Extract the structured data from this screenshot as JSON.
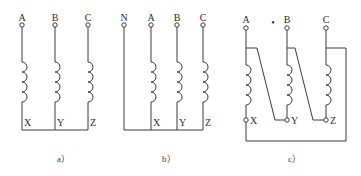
{
  "diagrams": {
    "a": {
      "caption": "a）",
      "top_labels": [
        "A",
        "B",
        "C"
      ],
      "bottom_labels": [
        "X",
        "Y",
        "Z"
      ]
    },
    "b": {
      "caption": "b）",
      "top_labels": [
        "N",
        "A",
        "B",
        "C"
      ],
      "bottom_labels": [
        "X",
        "Y",
        "Z"
      ]
    },
    "c": {
      "caption": "c）",
      "top_labels": [
        "A",
        "B",
        "C"
      ],
      "bottom_labels": [
        "X",
        "Y",
        "Z"
      ],
      "marker": "•"
    }
  },
  "colors": {
    "line": "#3a3a3a",
    "background": "#ffffff"
  }
}
